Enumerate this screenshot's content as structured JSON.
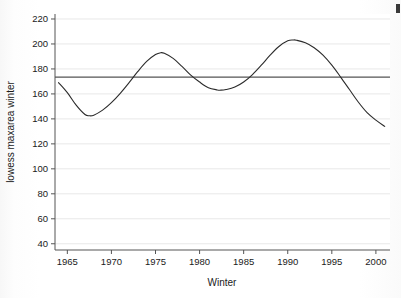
{
  "figure": {
    "background_color": "#ffffff",
    "plot_background_color": "#ffffff",
    "corner_artifact": true
  },
  "chart_data": {
    "type": "line",
    "title": "",
    "subtitle": "",
    "xlabel": "Winter",
    "ylabel": "lowess maxarea winter",
    "xlim": [
      1963.6,
      2001.6
    ],
    "ylim": [
      35,
      224
    ],
    "xticks": [
      1965,
      1970,
      1975,
      1980,
      1985,
      1990,
      1995,
      2000
    ],
    "xtick_labels": [
      "1965",
      "1970",
      "1975",
      "1980",
      "1985",
      "1990",
      "1995",
      "2000"
    ],
    "yticks": [
      40,
      60,
      80,
      100,
      120,
      140,
      160,
      180,
      200,
      220
    ],
    "ytick_labels": [
      "40",
      "60",
      "80",
      "100",
      "120",
      "140",
      "160",
      "180",
      "200",
      "220"
    ],
    "grid": "horizontal",
    "grid_color": "#e8e8e8",
    "legend": "none",
    "series": [
      {
        "name": "lowess maxarea winter",
        "type": "line",
        "color": "#2b2b2b",
        "line_width": 1.1,
        "x": [
          1964.0,
          1965.0,
          1966.0,
          1967.0,
          1967.5,
          1968.0,
          1969.0,
          1970.0,
          1971.0,
          1972.0,
          1973.0,
          1974.0,
          1975.0,
          1975.6,
          1976.0,
          1977.0,
          1978.0,
          1979.0,
          1980.0,
          1981.0,
          1982.0,
          1982.4,
          1983.0,
          1984.0,
          1985.0,
          1986.0,
          1987.0,
          1988.0,
          1989.0,
          1990.0,
          1990.6,
          1991.0,
          1992.0,
          1993.0,
          1994.0,
          1995.0,
          1996.0,
          1997.0,
          1998.0,
          1999.0,
          2000.0,
          2001.0
        ],
        "y": [
          169.0,
          161.0,
          151.0,
          143.5,
          142.5,
          143.0,
          147.0,
          153.0,
          160.5,
          169.0,
          178.0,
          186.0,
          191.5,
          193.0,
          192.5,
          188.5,
          182.0,
          175.0,
          169.5,
          165.0,
          163.2,
          163.0,
          163.5,
          165.5,
          169.5,
          175.5,
          183.0,
          191.0,
          198.0,
          202.5,
          203.2,
          203.0,
          201.0,
          197.0,
          191.0,
          183.0,
          173.5,
          163.5,
          153.5,
          145.0,
          139.0,
          134.0
        ]
      },
      {
        "name": "reference line",
        "type": "hline",
        "color": "#555555",
        "line_width": 1.3,
        "y_value": 173.5
      }
    ]
  }
}
